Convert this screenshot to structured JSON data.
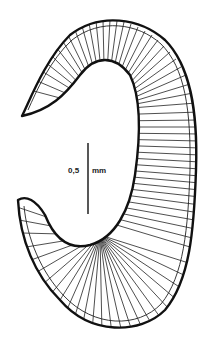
{
  "figure": {
    "ink_color": "#1a1a1a",
    "background_color": "#ffffff"
  },
  "scale_bar": {
    "value": "0,5",
    "unit": "mm"
  }
}
